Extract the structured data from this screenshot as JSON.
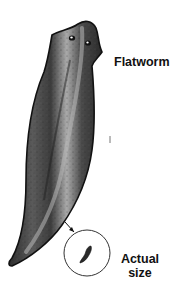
{
  "figure": {
    "labels": {
      "main": "Flatworm",
      "inset_line1": "Actual",
      "inset_line2": "size"
    },
    "colors": {
      "outline": "#111111",
      "body_dark": "#3a3a3a",
      "body_mid": "#6e6e6e",
      "body_light": "#a8a8a8",
      "background": "#ffffff"
    },
    "inset": {
      "shape": "circle",
      "description": "actual-size flatworm"
    }
  }
}
